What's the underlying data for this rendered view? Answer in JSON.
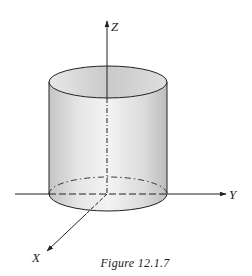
{
  "figure": {
    "caption": "Figure 12.1.7",
    "axes": {
      "x_label": "X",
      "y_label": "Y",
      "z_label": "Z"
    },
    "colors": {
      "line": "#222222",
      "surface_light": "#f2f2f2",
      "surface_dark": "#b8b8b8"
    }
  }
}
